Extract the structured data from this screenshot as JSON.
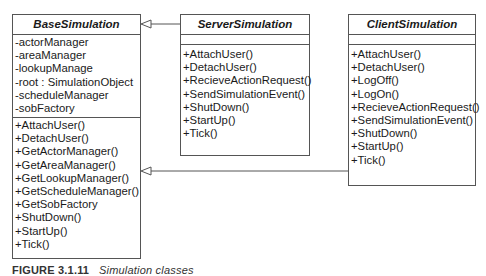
{
  "diagram": {
    "type": "uml-class-diagram",
    "classes": [
      {
        "id": "base",
        "name": "BaseSimulation",
        "abstract": true,
        "attributes": [
          "-actorManager",
          "-areaManager",
          "-lookupManage",
          "-root : SimulationObject",
          "-scheduleManager",
          "-sobFactory"
        ],
        "methods": [
          "+AttachUser()",
          "+DetachUser()",
          "+GetActorManager()",
          "+GetAreaManager()",
          "+GetLookupManager()",
          "+GetScheduleManager()",
          "+GetSobFactory",
          "+ShutDown()",
          "+StartUp()",
          "+Tick()"
        ]
      },
      {
        "id": "server",
        "name": "ServerSimulation",
        "attributes": [],
        "methods": [
          "+AttachUser()",
          "+DetachUser()",
          "+RecieveActionRequest()",
          "+SendSimulationEvent()",
          "+ShutDown()",
          "+StartUp()",
          "+Tick()"
        ]
      },
      {
        "id": "client",
        "name": "ClientSimulation",
        "attributes": [],
        "methods": [
          "+AttachUser()",
          "+DetachUser()",
          "+LogOff()",
          "+LogOn()",
          "+RecieveActionRequest()",
          "+SendSimulationEvent()",
          "+ShutDown()",
          "+StartUp()",
          "+Tick()"
        ]
      }
    ],
    "relationships": [
      {
        "type": "generalization",
        "from": "ServerSimulation",
        "to": "BaseSimulation"
      },
      {
        "type": "generalization",
        "from": "ClientSimulation",
        "to": "BaseSimulation"
      }
    ],
    "colors": {
      "line": "#555555",
      "text": "#1a1a1a",
      "background": "#ffffff"
    }
  },
  "caption": {
    "label": "FIGURE 3.1.11",
    "text": "Simulation classes"
  }
}
